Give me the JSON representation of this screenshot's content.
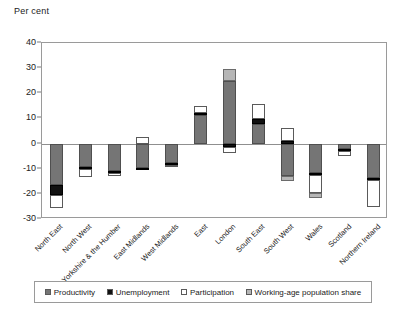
{
  "figure": {
    "axis_title": "Per cent"
  },
  "chart_data": {
    "type": "bar",
    "stacked": true,
    "title": "",
    "subtitle": "",
    "xlabel": "",
    "ylabel": "Per cent",
    "ylim": [
      -30,
      40
    ],
    "yticks": [
      -30,
      -20,
      -10,
      0,
      10,
      20,
      30,
      40
    ],
    "ytick_labels": [
      "-30",
      "-20",
      "-10",
      "0",
      "10",
      "20",
      "30",
      "40"
    ],
    "grid": false,
    "legend_position": "bottom",
    "categories": [
      "North East",
      "North West",
      "Yorkshire & the Humber",
      "East Midlands",
      "West Midlands",
      "East",
      "London",
      "South East",
      "South West",
      "Wales",
      "Scotland",
      "Northern Ireland"
    ],
    "series": [
      {
        "name": "Productivity",
        "color": "#757575",
        "values": [
          -16.3,
          -9.4,
          -10.9,
          -9.6,
          -7.7,
          11.4,
          25.0,
          7.8,
          -13.0,
          -11.9,
          -2.0,
          -13.8
        ]
      },
      {
        "name": "Unemployment",
        "color": "#111111",
        "values": [
          -4.0,
          -0.8,
          -0.8,
          -0.4,
          -0.7,
          0.8,
          -1.4,
          2.1,
          1.2,
          -0.7,
          -1.1,
          -0.6
        ]
      },
      {
        "name": "Participation",
        "color": "#ffffff",
        "values": [
          -5.2,
          -3.1,
          -1.1,
          2.6,
          -0.2,
          2.9,
          -2.2,
          5.7,
          4.8,
          -7.0,
          -1.7,
          -10.8
        ]
      },
      {
        "name": "Working-age population share",
        "color": "#b6b6b6",
        "values": [
          0.0,
          0.0,
          0.0,
          0.0,
          0.0,
          0.0,
          4.8,
          0.0,
          -2.0,
          -2.0,
          0.0,
          0.0
        ]
      }
    ]
  },
  "legend": {
    "items": [
      {
        "label": "Productivity",
        "color": "#757575"
      },
      {
        "label": "Unemployment",
        "color": "#111111"
      },
      {
        "label": "Participation",
        "color": "#ffffff"
      },
      {
        "label": "Working-age population share",
        "color": "#b6b6b6"
      }
    ]
  }
}
